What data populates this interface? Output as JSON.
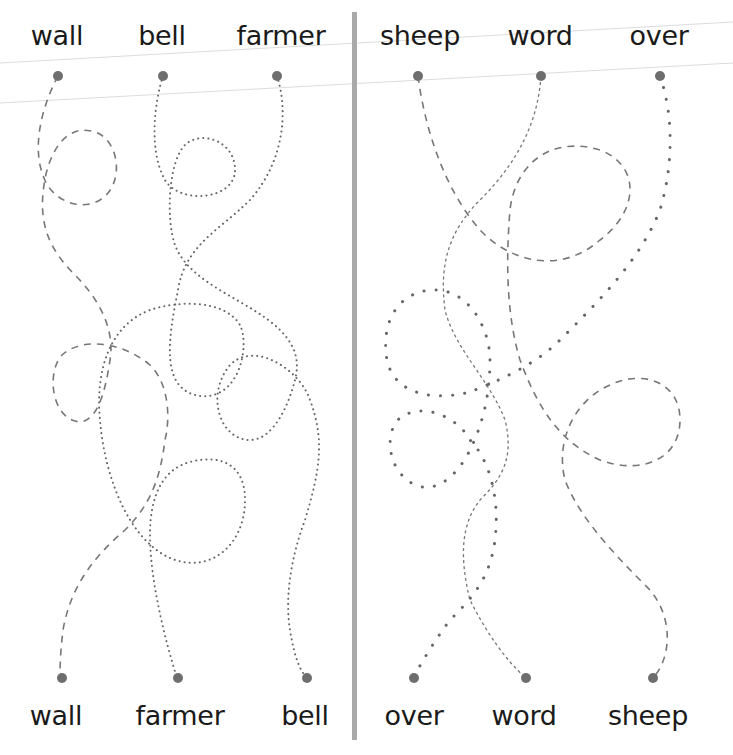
{
  "worksheet": {
    "left_panel": {
      "top_words": [
        "wall",
        "bell",
        "farmer"
      ],
      "bottom_words": [
        "wall",
        "farmer",
        "bell"
      ]
    },
    "right_panel": {
      "top_words": [
        "sheep",
        "word",
        "over"
      ],
      "bottom_words": [
        "over",
        "word",
        "sheep"
      ]
    },
    "colors": {
      "text": "#1a1a1a",
      "line": "#777777",
      "dot": "#6e6e6e",
      "divider": "#a9a9a9",
      "guide_line": "#d8d8d8"
    }
  }
}
